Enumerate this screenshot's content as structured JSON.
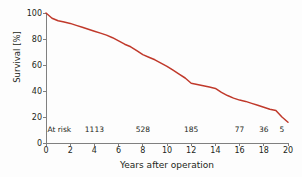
{
  "chart_data": {
    "type": "line",
    "title": "",
    "xlabel": "Years after operation",
    "ylabel": "Survival [%]",
    "xlim": [
      0,
      20
    ],
    "ylim": [
      0,
      100
    ],
    "grid": false,
    "legend": "none",
    "line_color": "#c0392b",
    "background_color": "#fdfdfd",
    "axis_color": "#808080",
    "text_color": "#231f20",
    "xticks": [
      0,
      2,
      4,
      6,
      8,
      10,
      12,
      14,
      16,
      18,
      20
    ],
    "xticklabels": [
      "0",
      "2",
      "4",
      "6",
      "8",
      "10",
      "12",
      "14",
      "16",
      "18",
      "20"
    ],
    "yticks": [
      0,
      20,
      40,
      60,
      80,
      100
    ],
    "yticklabels": [
      "0",
      "20",
      "40",
      "60",
      "80",
      "100"
    ],
    "series": [
      {
        "name": "Survival",
        "x": [
          0,
          0.5,
          1,
          1.5,
          2,
          2.5,
          3,
          3.5,
          4,
          4.5,
          5,
          5.5,
          6,
          6.5,
          7,
          7.5,
          8,
          8.5,
          9,
          9.5,
          10,
          10.5,
          11,
          11.5,
          12,
          12.5,
          13,
          13.5,
          14,
          14.5,
          15,
          15.5,
          16,
          16.5,
          17,
          17.5,
          18,
          18.5,
          19,
          19.5,
          20
        ],
        "y": [
          100,
          96,
          94,
          93,
          92,
          90.5,
          89,
          87.5,
          86,
          84.5,
          83,
          81,
          78.5,
          76,
          74,
          71,
          68,
          66,
          64,
          61.5,
          59,
          56,
          53,
          50,
          46,
          45,
          44,
          43,
          42,
          39,
          36.5,
          34.5,
          33,
          32,
          30.5,
          29,
          27.5,
          26,
          25,
          20,
          16
        ]
      }
    ],
    "annotations": {
      "label": "At risk",
      "label_x": 1.1,
      "points": [
        {
          "x": 4,
          "value": "1113"
        },
        {
          "x": 8,
          "value": "528"
        },
        {
          "x": 12,
          "value": "185"
        },
        {
          "x": 16,
          "value": "77"
        },
        {
          "x": 18,
          "value": "36"
        },
        {
          "x": 19.5,
          "value": "5"
        }
      ]
    }
  }
}
